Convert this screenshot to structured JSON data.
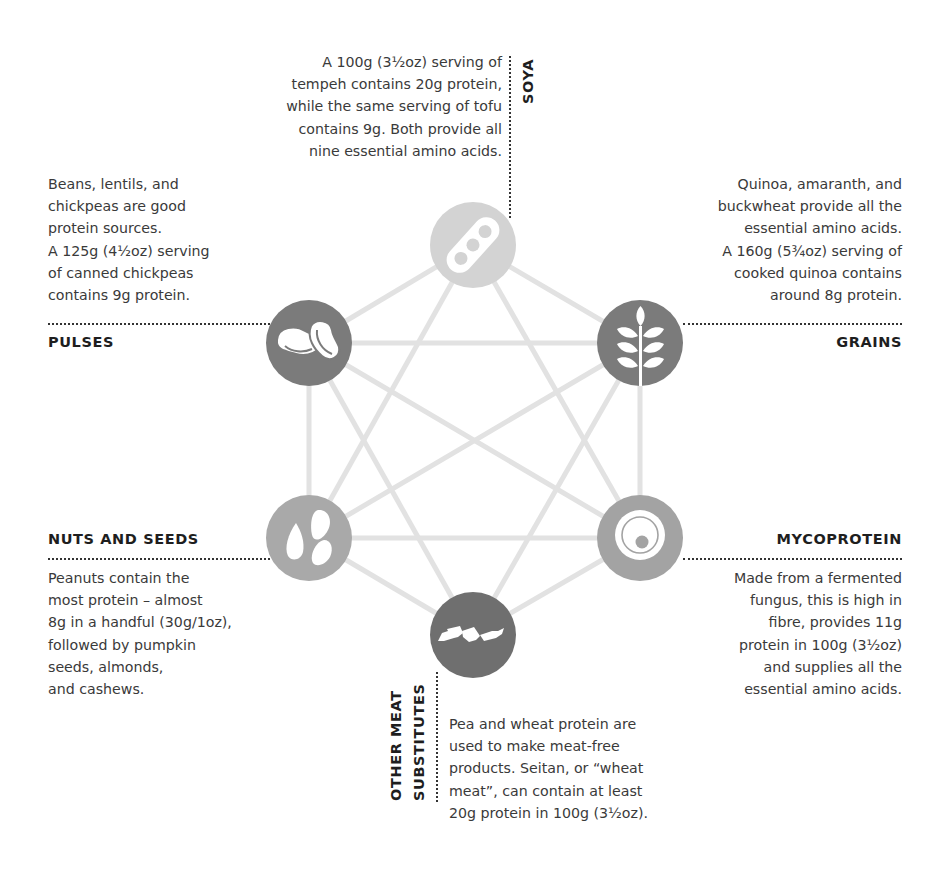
{
  "diagram": {
    "colors": {
      "connector": "#e2e2e2",
      "soya": "#d3d3d3",
      "pulses": "#7b7b7b",
      "grains": "#7b7b7b",
      "nuts_and_seeds": "#a9a9a9",
      "mycoprotein": "#a3a3a3",
      "other_meat_substitutes": "#6f6f6f",
      "heading": "#1e1e1e",
      "body_text": "#3a3a3a"
    },
    "nodes": [
      {
        "id": "soya",
        "icon": "soybean-pod-icon"
      },
      {
        "id": "pulses",
        "icon": "beans-icon"
      },
      {
        "id": "grains",
        "icon": "wheat-ear-icon"
      },
      {
        "id": "nuts_and_seeds",
        "icon": "seeds-icon"
      },
      {
        "id": "mycoprotein",
        "icon": "fungus-cell-icon"
      },
      {
        "id": "other_meat_substitutes",
        "icon": "meat-substitute-pieces-icon"
      }
    ]
  },
  "soya": {
    "heading": "SOYA",
    "lines": [
      "A 100g (3½oz) serving of",
      "tempeh contains 20g protein,",
      "while the same serving of tofu",
      "contains 9g. Both provide all",
      "nine essential amino acids."
    ]
  },
  "pulses": {
    "heading": "PULSES",
    "lines": [
      "Beans, lentils, and",
      "chickpeas are good",
      "protein sources.",
      "A 125g (4½oz) serving",
      "of canned chickpeas",
      "contains 9g protein."
    ]
  },
  "grains": {
    "heading": "GRAINS",
    "lines": [
      "Quinoa, amaranth, and",
      "buckwheat provide all the",
      "essential amino acids.",
      "A 160g (5¾oz) serving of",
      "cooked quinoa contains",
      "around 8g protein."
    ]
  },
  "nuts_and_seeds": {
    "heading": "NUTS AND SEEDS",
    "lines": [
      "Peanuts contain the",
      "most protein – almost",
      "8g in a handful (30g/1oz),",
      "followed by pumpkin",
      "seeds, almonds,",
      "and cashews."
    ]
  },
  "mycoprotein": {
    "heading": "MYCOPROTEIN",
    "lines": [
      "Made from a fermented",
      "fungus, this is high in",
      "fibre, provides 11g",
      "protein in 100g (3½oz)",
      "and supplies all the",
      "essential amino acids."
    ]
  },
  "other_meat_substitutes": {
    "heading_line1": "OTHER MEAT",
    "heading_line2": "SUBSTITUTES",
    "lines": [
      "Pea and wheat protein are",
      "used to make meat-free",
      "products. Seitan, or “wheat",
      "meat”, can contain at least",
      "20g protein in 100g (3½oz)."
    ]
  }
}
